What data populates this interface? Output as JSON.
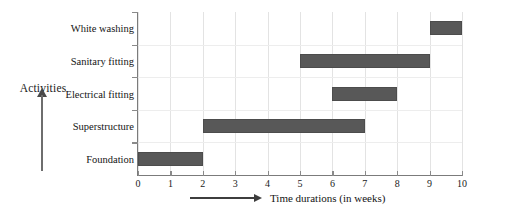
{
  "chart_data": {
    "type": "bar",
    "orientation": "horizontal",
    "subtype": "gantt",
    "title": "",
    "xlabel": "Time durations (in weeks)",
    "ylabel": "Activities",
    "xlim": [
      0,
      10
    ],
    "xticks": [
      "0",
      "1",
      "2",
      "3",
      "4",
      "5",
      "6",
      "7",
      "8",
      "9",
      "10"
    ],
    "categories": [
      "White washing",
      "Sanitary fitting",
      "Electrical fitting",
      "Superstructure",
      "Foundation"
    ],
    "grid": true,
    "legend": "none",
    "bar_color": "#585858",
    "tasks": [
      {
        "name": "White washing",
        "start": 9,
        "end": 10,
        "duration": 1
      },
      {
        "name": "Sanitary fitting",
        "start": 5,
        "end": 9,
        "duration": 4
      },
      {
        "name": "Electrical fitting",
        "start": 6,
        "end": 8,
        "duration": 2
      },
      {
        "name": "Superstructure",
        "start": 2,
        "end": 7,
        "duration": 5
      },
      {
        "name": "Foundation",
        "start": 0,
        "end": 2,
        "duration": 2
      }
    ]
  }
}
